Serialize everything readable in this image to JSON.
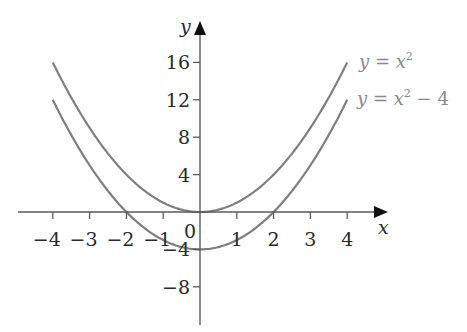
{
  "chart_data": {
    "type": "line",
    "title": "",
    "xlabel": "x",
    "ylabel": "y",
    "xlim": [
      -4.5,
      4.6
    ],
    "ylim": [
      -10.5,
      18
    ],
    "x_ticks": [
      -4,
      -3,
      -2,
      -1,
      1,
      2,
      3,
      4
    ],
    "x_tick_labels": [
      "−4",
      "−3",
      "−2",
      "−1",
      "1",
      "2",
      "3",
      "4"
    ],
    "y_ticks": [
      16,
      12,
      8,
      4,
      -4,
      -8
    ],
    "y_tick_labels": [
      "16",
      "12",
      "8",
      "4",
      "−4",
      "−8"
    ],
    "origin_label": "0",
    "grid": false,
    "legend_position": "inline-right-end-of-curves",
    "series": [
      {
        "name": "y = x^2",
        "label_parts": {
          "lhs": "y",
          "eq": " = ",
          "base": "x",
          "exp": "2",
          "rest": ""
        },
        "color": "#7f7f7f",
        "x": [
          -4,
          -3,
          -2,
          -1,
          0,
          1,
          2,
          3,
          4
        ],
        "y": [
          16,
          9,
          4,
          1,
          0,
          1,
          4,
          9,
          16
        ]
      },
      {
        "name": "y = x^2 - 4",
        "label_parts": {
          "lhs": "y",
          "eq": " = ",
          "base": "x",
          "exp": "2",
          "rest": " − 4"
        },
        "color": "#7f7f7f",
        "x": [
          -4,
          -3,
          -2,
          -1,
          0,
          1,
          2,
          3,
          4
        ],
        "y": [
          12,
          5,
          0,
          -3,
          -4,
          -3,
          0,
          5,
          12
        ]
      }
    ]
  }
}
